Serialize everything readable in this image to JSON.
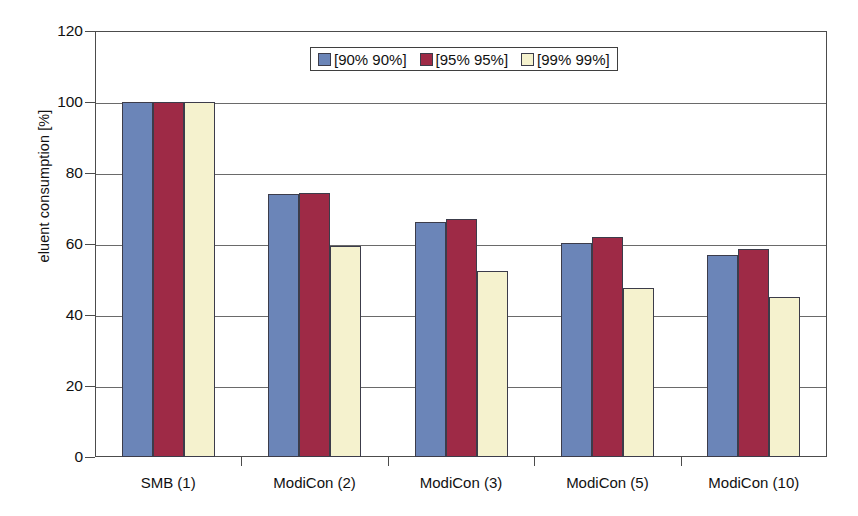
{
  "chart_data": {
    "type": "bar",
    "title": "",
    "xlabel": "",
    "ylabel": "eluent consumption [%]",
    "ylim": [
      0,
      120
    ],
    "ytick_step": 20,
    "yticks": [
      0,
      20,
      40,
      60,
      80,
      100,
      120
    ],
    "ytick_labels": [
      "0",
      "20",
      "40",
      "60",
      "80",
      "100",
      "120"
    ],
    "grid": true,
    "grid_axis": "y",
    "legend_position": "top-center",
    "categories": [
      "SMB (1)",
      "ModiCon (2)",
      "ModiCon (3)",
      "ModiCon (5)",
      "ModiCon (10)"
    ],
    "series": [
      {
        "name": "[90% 90%]",
        "color": "#6B85B8",
        "values": [
          100,
          74.0,
          66.2,
          60.3,
          56.8
        ]
      },
      {
        "name": "[95% 95%]",
        "color": "#9E2A46",
        "values": [
          100,
          74.4,
          67.0,
          61.9,
          58.5
        ]
      },
      {
        "name": "[99% 99%]",
        "color": "#F5F2CE",
        "values": [
          100,
          59.4,
          52.4,
          47.7,
          45.2
        ]
      }
    ]
  },
  "colors": {
    "series_blue": "#6B85B8",
    "series_red": "#9E2A46",
    "series_cream": "#F5F2CE",
    "axis": "#4c4c4c",
    "gridline": "#6a6a6a",
    "background": "#ffffff",
    "text": "#111111"
  }
}
